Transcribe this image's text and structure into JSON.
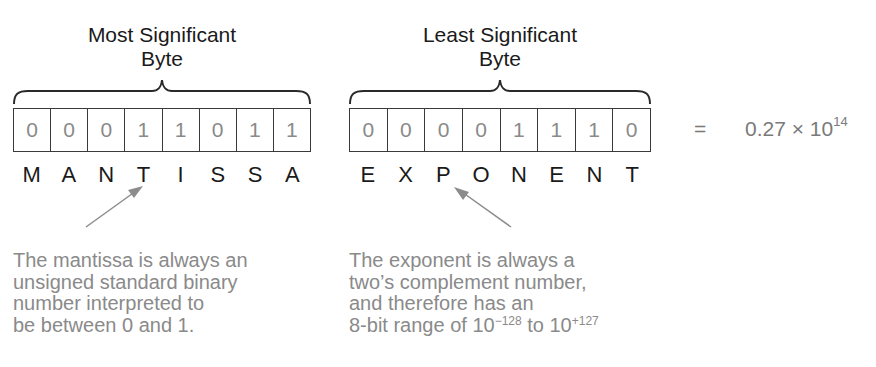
{
  "msb": {
    "title_line1": "Most Significant",
    "title_line2": "Byte",
    "bits": [
      "0",
      "0",
      "0",
      "1",
      "1",
      "0",
      "1",
      "1"
    ],
    "letters": [
      "M",
      "A",
      "N",
      "T",
      "I",
      "S",
      "S",
      "A"
    ]
  },
  "lsb": {
    "title_line1": "Least Significant",
    "title_line2": "Byte",
    "bits": [
      "0",
      "0",
      "0",
      "0",
      "1",
      "1",
      "1",
      "0"
    ],
    "letters": [
      "E",
      "X",
      "P",
      "O",
      "N",
      "E",
      "N",
      "T"
    ]
  },
  "result": {
    "equals": "=",
    "mantissa_value": "0.27",
    "times": "×",
    "base": "10",
    "exponent": "14"
  },
  "notes": {
    "mantissa": {
      "lines": [
        "The mantissa is always an",
        "unsigned standard binary",
        "number interpreted to",
        "be between 0 and 1."
      ]
    },
    "exponent": {
      "lines": [
        "The exponent is always a",
        "two’s complement number,",
        "and therefore has an"
      ],
      "range_prefix": "8-bit range of ",
      "range_low_base": "10",
      "range_low_exp": "−128",
      "range_mid": " to ",
      "range_high_base": "10",
      "range_high_exp": "+127"
    }
  },
  "colors": {
    "line": "#3a3a3a",
    "bit_text": "#8a8a8a",
    "note_text": "#8a8a8a",
    "arrow": "#8c8c8c",
    "heading_text": "#1a1a1a"
  }
}
